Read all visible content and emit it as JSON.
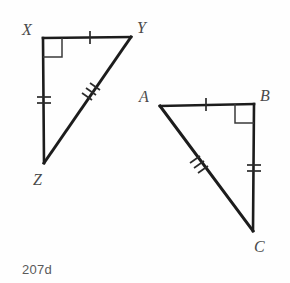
{
  "figure": {
    "caption": "207d",
    "background_color": "#fefefe",
    "stroke_color": "#1c1c1c",
    "mark_color": "#2b2b2b",
    "label_color": "#4a4a4a",
    "triangles": [
      {
        "name": "triangle-xyz",
        "vertices": [
          {
            "label": "X",
            "x": 43,
            "y": 38,
            "label_x": 22,
            "label_y": 22
          },
          {
            "label": "Y",
            "x": 131,
            "y": 37,
            "label_x": 137,
            "label_y": 20
          },
          {
            "label": "Z",
            "x": 44,
            "y": 163,
            "label_x": 33,
            "label_y": 172
          }
        ],
        "right_angle_at": "X",
        "sides": [
          {
            "name": "XY",
            "from": "X",
            "to": "Y",
            "ticks": 1
          },
          {
            "name": "XZ",
            "from": "X",
            "to": "Z",
            "ticks": 2
          },
          {
            "name": "YZ",
            "from": "Y",
            "to": "Z",
            "ticks": 3
          }
        ]
      },
      {
        "name": "triangle-abc",
        "vertices": [
          {
            "label": "A",
            "x": 160,
            "y": 106,
            "label_x": 139,
            "label_y": 89
          },
          {
            "label": "B",
            "x": 254,
            "y": 104,
            "label_x": 260,
            "label_y": 88
          },
          {
            "label": "C",
            "x": 253,
            "y": 231,
            "label_x": 254,
            "label_y": 239
          }
        ],
        "right_angle_at": "B",
        "sides": [
          {
            "name": "AB",
            "from": "A",
            "to": "B",
            "ticks": 1
          },
          {
            "name": "BC",
            "from": "B",
            "to": "C",
            "ticks": 2
          },
          {
            "name": "AC",
            "from": "A",
            "to": "C",
            "ticks": 3
          }
        ]
      }
    ]
  }
}
